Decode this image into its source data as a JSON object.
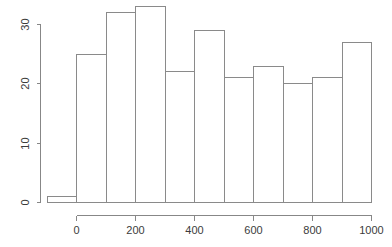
{
  "chart_data": {
    "type": "bar",
    "subtype": "histogram",
    "title": "",
    "subtitle": "",
    "xlabel": "",
    "ylabel": "",
    "categories": [
      "-100",
      "0",
      "100",
      "200",
      "300",
      "400",
      "500",
      "600",
      "700",
      "800",
      "900"
    ],
    "bin_edges": [
      -100,
      0,
      100,
      200,
      300,
      400,
      500,
      600,
      700,
      800,
      900,
      1000
    ],
    "bin_width": 100,
    "values": [
      1,
      25,
      32,
      33,
      22,
      29,
      21,
      23,
      20,
      21,
      27
    ],
    "bins": [
      {
        "from": -100,
        "to": 0,
        "count": 1
      },
      {
        "from": 0,
        "to": 100,
        "count": 25
      },
      {
        "from": 100,
        "to": 200,
        "count": 32
      },
      {
        "from": 200,
        "to": 300,
        "count": 33
      },
      {
        "from": 300,
        "to": 400,
        "count": 22
      },
      {
        "from": 400,
        "to": 500,
        "count": 29
      },
      {
        "from": 500,
        "to": 600,
        "count": 21
      },
      {
        "from": 600,
        "to": 700,
        "count": 23
      },
      {
        "from": 700,
        "to": 800,
        "count": 20
      },
      {
        "from": 800,
        "to": 900,
        "count": 21
      },
      {
        "from": 900,
        "to": 1000,
        "count": 27
      }
    ],
    "xlim": [
      -100,
      1000
    ],
    "ylim": [
      0,
      33
    ],
    "xticks": [
      0,
      200,
      400,
      600,
      800,
      1000
    ],
    "xtick_labels": [
      "0",
      "200",
      "400",
      "600",
      "800",
      "1000"
    ],
    "yticks": [
      0,
      10,
      20,
      30
    ],
    "ytick_labels": [
      "0",
      "10",
      "20",
      "30"
    ],
    "grid": false,
    "legend": false,
    "legend_position": "none",
    "bar_fill": "#ffffff",
    "bar_stroke": "#8a8a8a",
    "axis_color": "#878787",
    "text_color": "#3b3b3b",
    "background": "#ffffff",
    "y_tick_label_rotation": -90
  }
}
